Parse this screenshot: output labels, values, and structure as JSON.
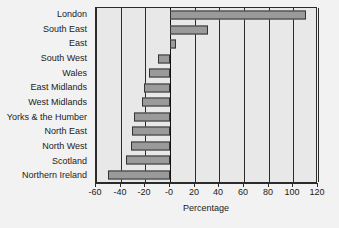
{
  "chart_data": {
    "type": "bar",
    "orientation": "horizontal",
    "title": "",
    "xlabel": "Percentage",
    "ylabel": "",
    "xlim": [
      -60,
      120
    ],
    "xticks": [
      -60,
      -40,
      -20,
      0,
      20,
      40,
      60,
      80,
      100,
      120
    ],
    "xtick_labels": [
      "-60",
      "-40",
      "-20",
      "-0",
      "20",
      "40",
      "60",
      "80",
      "100",
      "120"
    ],
    "grid": true,
    "grid_axis": "x",
    "legend": false,
    "categories": [
      "London",
      "South East",
      "East",
      "South West",
      "Wales",
      "East Midlands",
      "West Midlands",
      "Yorks & the Humber",
      "North East",
      "North West",
      "Scotland",
      "Northern Ireland"
    ],
    "values": [
      110,
      31,
      5,
      -10,
      -17,
      -21,
      -23,
      -29,
      -31,
      -32,
      -36,
      -50
    ],
    "series": [
      {
        "name": "Percentage",
        "values": [
          110,
          31,
          5,
          -10,
          -17,
          -21,
          -23,
          -29,
          -31,
          -32,
          -36,
          -50
        ]
      }
    ]
  },
  "colors": {
    "figure_background": "#f2f2f2",
    "plot_background": "#e8e8e8",
    "bar_fill": "#9a9a9a",
    "bar_edge": "#333333",
    "axis": "#2b2b2b",
    "gridline": "#2b2b2b",
    "text": "#1b1b1b"
  }
}
